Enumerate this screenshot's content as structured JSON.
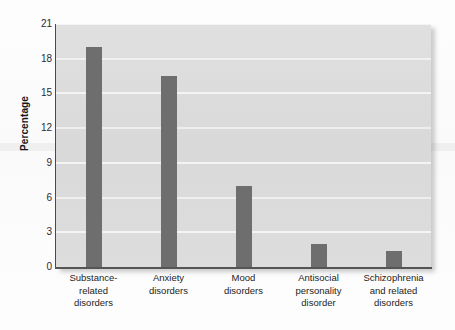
{
  "chart_data": {
    "type": "bar",
    "title": "",
    "subtitle": "",
    "xlabel": "",
    "ylabel": "Percentage",
    "ylim": [
      0,
      21
    ],
    "yticks": [
      21,
      18,
      15,
      12,
      9,
      6,
      3,
      0
    ],
    "ytick_labels": [
      "21",
      "18",
      "15",
      "12",
      "9",
      "6",
      "3",
      "0"
    ],
    "grid": true,
    "legend": null,
    "categories": [
      "Substance-related disorders",
      "Anxiety disorders",
      "Mood disorders",
      "Antisocial personality disorder",
      "Schizophrenia and related disorders"
    ],
    "category_lines": [
      [
        "Substance-",
        "related",
        "disorders"
      ],
      [
        "Anxiety",
        "disorders"
      ],
      [
        "Mood",
        "disorders"
      ],
      [
        "Antisocial",
        "personality",
        "disorder"
      ],
      [
        "Schizophrenia",
        "and related",
        "disorders"
      ]
    ],
    "values": [
      19.0,
      16.5,
      7.0,
      2.0,
      1.4
    ],
    "bar_color": "#6e6e6e",
    "plot_background": "#dcdcdc",
    "gridline_color": "#f4f4f4",
    "axis_color": "#4a4a4a"
  }
}
